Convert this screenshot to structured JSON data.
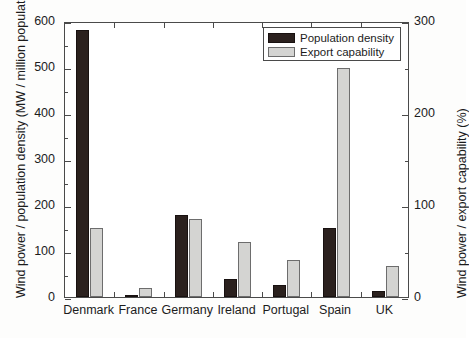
{
  "chart_data": {
    "type": "bar",
    "title": "",
    "subtitle": "",
    "categories": [
      "Denmark",
      "France",
      "Germany",
      "Ireland",
      "Portugal",
      "Spain",
      "UK"
    ],
    "series": [
      {
        "name": "Population density",
        "axis": "left",
        "color": "#2b211e",
        "units": "MW / million population",
        "values": [
          580,
          5,
          178,
          40,
          25,
          150,
          12
        ]
      },
      {
        "name": "Export capability",
        "axis": "right",
        "color": "#d4d4d2",
        "units": "%",
        "values": [
          75,
          10,
          85,
          60,
          40,
          249,
          34
        ]
      }
    ],
    "xlabel": "",
    "ylabel": "Wind power / population density (MW / million population)",
    "ylabel_right": "Wind power / export capability (%)",
    "ylim": [
      0,
      600
    ],
    "ylim_right": [
      0,
      300
    ],
    "yticks": [
      0,
      100,
      200,
      300,
      400,
      500,
      600
    ],
    "yticks_right": [
      0,
      100,
      200,
      300
    ],
    "yminor_ticks": [
      50,
      150,
      250,
      350,
      450,
      550
    ],
    "yminor_ticks_right": [
      50,
      150,
      250
    ],
    "grid": false,
    "legend_position": "top-right",
    "legend_entries": [
      "Population density",
      "Export capability"
    ]
  },
  "axes": {
    "left_title": "Wind power / population density (MW / million population)",
    "right_title": "Wind power / export capability (%)",
    "left_ticks": [
      "0",
      "100",
      "200",
      "300",
      "400",
      "500",
      "600"
    ],
    "right_ticks": [
      "0",
      "100",
      "200",
      "300"
    ]
  },
  "legend": {
    "items": [
      {
        "label": "Population density",
        "swatch": "dark"
      },
      {
        "label": "Export capability",
        "swatch": "light"
      }
    ]
  }
}
